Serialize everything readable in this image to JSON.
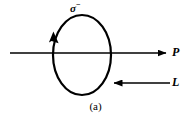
{
  "figure": {
    "caption": "(a)",
    "background_color": "#ffffff",
    "stroke_color": "#000000",
    "labels": {
      "particle": "σ",
      "particle_charge": "−",
      "particle_full": "σ−",
      "momentum": "P",
      "angular_momentum": "L"
    },
    "elements": {
      "loop_name": "spin-loop",
      "loop_direction_arrow": "counterclockwise-arrowhead",
      "axis_line": "horizontal-axis",
      "momentum_arrow": "momentum-arrow-right",
      "angular_momentum_arrow": "angular-momentum-arrow-left"
    },
    "geometry": {
      "ellipse_cx": 82,
      "ellipse_cy": 55,
      "ellipse_rx": 29,
      "ellipse_ry": 40,
      "axis_y": 53,
      "axis_x_start": 10,
      "axis_x_end": 166,
      "l_arrow_y": 83,
      "l_arrow_x_start": 170,
      "l_arrow_x_end": 114
    }
  }
}
